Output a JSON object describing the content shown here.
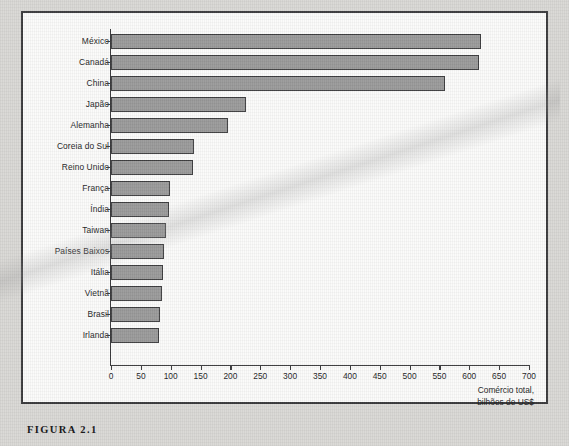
{
  "figure": {
    "caption": "FIGURA 2.1"
  },
  "chart_data": {
    "type": "bar",
    "orientation": "horizontal",
    "title": "",
    "xlabel": "Comércio total, bilhões de US$",
    "ylabel": "",
    "xlim": [
      0,
      700
    ],
    "xticks": [
      0,
      50,
      100,
      150,
      200,
      250,
      300,
      350,
      400,
      450,
      500,
      550,
      600,
      650,
      700
    ],
    "xtick_labels": [
      "0",
      "50",
      "100",
      "150",
      "200",
      "250",
      "300",
      "350",
      "400",
      "450",
      "500",
      "550",
      "600",
      "650",
      "700"
    ],
    "grid": false,
    "legend": null,
    "bar_color": "#9a9a9a",
    "bar_edge_color": "#3e3e40",
    "categories": [
      "México",
      "Canadá",
      "China",
      "Japão",
      "Alemanha",
      "Coreia do Sul",
      "Reino Unido",
      "França",
      "Índia",
      "Taiwan",
      "Países Baixos",
      "Itália",
      "Vietnã",
      "Brasil",
      "Irlanda"
    ],
    "values": [
      620,
      617,
      560,
      226,
      196,
      139,
      138,
      99,
      97,
      92,
      89,
      87,
      85,
      82,
      80
    ]
  },
  "axis_label_lines": {
    "line1": "Comércio total,",
    "line2": "bilhões de US$"
  }
}
